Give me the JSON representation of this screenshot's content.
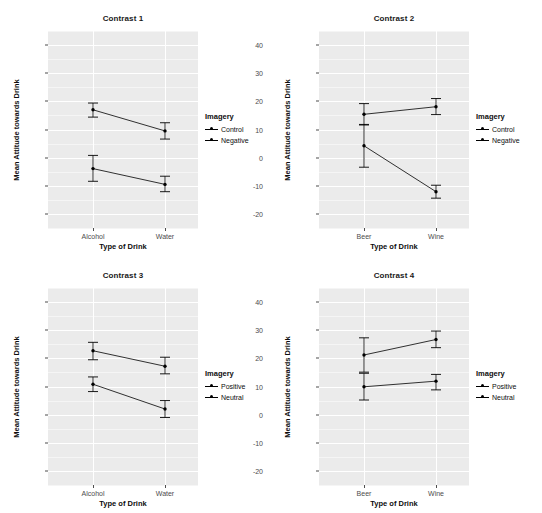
{
  "figure": {
    "panel_background": "#ebebeb",
    "grid_color": "#ffffff",
    "series_color": "#000000",
    "facets": [
      "Contrast 1",
      "Contrast 2",
      "Contrast 3",
      "Contrast 4"
    ]
  },
  "axis": {
    "ylabel": "Mean Attitude towards Drink",
    "xlabel": "Type of Drink",
    "yticks": [
      40,
      30,
      20,
      10,
      0,
      -10,
      -20
    ],
    "ytick_labels": [
      "40",
      "30",
      "20",
      "10",
      "0",
      "-10",
      "-20"
    ],
    "ylim": [
      -25,
      45
    ]
  },
  "legend": {
    "title": "Imagery",
    "groups_ab": [
      "Control",
      "Negative"
    ],
    "groups_cd": [
      "Positive",
      "Neutral"
    ]
  },
  "chart_data": [
    {
      "type": "line",
      "title": "Contrast 1",
      "xlabel": "Type of Drink",
      "ylabel": "Mean Attitude towards Drink",
      "categories": [
        "Alcohol",
        "Water"
      ],
      "ylim": [
        -25,
        45
      ],
      "yticks": [
        40,
        30,
        20,
        10,
        0,
        -10,
        -20
      ],
      "grid": true,
      "legend_title": "Imagery",
      "legend_position": "right",
      "series": [
        {
          "name": "Control",
          "values": [
            17.0,
            9.5
          ],
          "ci_lower": [
            14.4,
            6.6
          ],
          "ci_upper": [
            19.4,
            12.4
          ]
        },
        {
          "name": "Negative",
          "values": [
            -3.9,
            -9.5
          ],
          "ci_lower": [
            -8.4,
            -12.1
          ],
          "ci_upper": [
            0.8,
            -6.6
          ]
        }
      ]
    },
    {
      "type": "line",
      "title": "Contrast 2",
      "xlabel": "Type of Drink",
      "ylabel": "Mean Attitude towards Drink",
      "categories": [
        "Beer",
        "Wine"
      ],
      "ylim": [
        -25,
        45
      ],
      "yticks": [
        40,
        30,
        20,
        10,
        0,
        -10,
        -20
      ],
      "grid": true,
      "legend_title": "Imagery",
      "legend_position": "right",
      "series": [
        {
          "name": "Control",
          "values": [
            15.4,
            18.1
          ],
          "ci_lower": [
            11.6,
            15.3
          ],
          "ci_upper": [
            19.2,
            21.0
          ]
        },
        {
          "name": "Negative",
          "values": [
            4.2,
            -12.1
          ],
          "ci_lower": [
            -3.4,
            -14.4
          ],
          "ci_upper": [
            11.8,
            -9.8
          ]
        }
      ]
    },
    {
      "type": "line",
      "title": "Contrast 3",
      "xlabel": "Type of Drink",
      "ylabel": "Mean Attitude towards Drink",
      "categories": [
        "Alcohol",
        "Water"
      ],
      "ylim": [
        -25,
        45
      ],
      "yticks": [
        40,
        30,
        20,
        10,
        0,
        -10,
        -20
      ],
      "grid": true,
      "legend_title": "Imagery",
      "legend_position": "right",
      "series": [
        {
          "name": "Positive",
          "values": [
            22.7,
            17.2
          ],
          "ci_lower": [
            19.5,
            14.5
          ],
          "ci_upper": [
            25.7,
            20.4
          ]
        },
        {
          "name": "Neutral",
          "values": [
            10.8,
            2.0
          ],
          "ci_lower": [
            8.2,
            -1.0
          ],
          "ci_upper": [
            13.4,
            5.0
          ]
        }
      ]
    },
    {
      "type": "line",
      "title": "Contrast 4",
      "xlabel": "Type of Drink",
      "ylabel": "Mean Attitude towards Drink",
      "categories": [
        "Beer",
        "Wine"
      ],
      "ylim": [
        -25,
        45
      ],
      "yticks": [
        40,
        30,
        20,
        10,
        0,
        -10,
        -20
      ],
      "grid": true,
      "legend_title": "Imagery",
      "legend_position": "right",
      "series": [
        {
          "name": "Positive",
          "values": [
            21.2,
            26.7
          ],
          "ci_lower": [
            15.1,
            23.8
          ],
          "ci_upper": [
            27.3,
            29.7
          ]
        },
        {
          "name": "Neutral",
          "values": [
            9.9,
            11.9
          ],
          "ci_lower": [
            5.2,
            8.8
          ],
          "ci_upper": [
            14.7,
            14.3
          ]
        }
      ]
    }
  ]
}
